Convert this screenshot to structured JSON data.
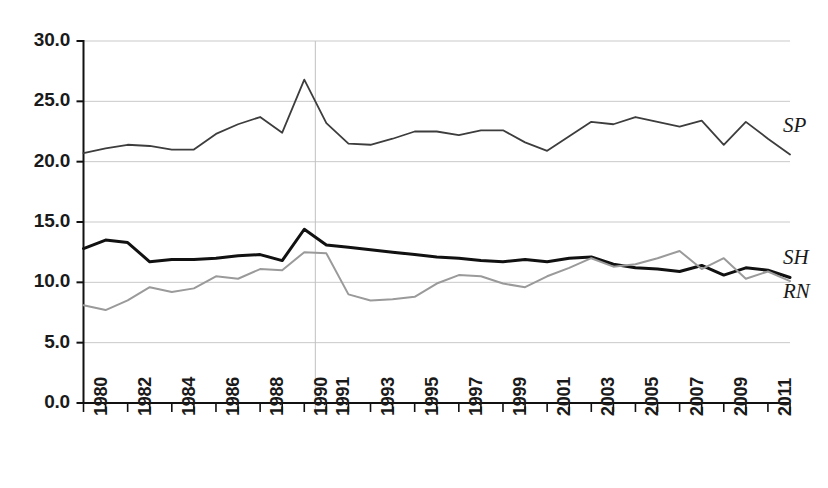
{
  "chart_data": {
    "type": "line",
    "title": "",
    "subtitle": "",
    "xlabel": "",
    "ylabel": "",
    "xlim": [
      1980,
      2012
    ],
    "ylim": [
      0.0,
      30.0
    ],
    "grid": true,
    "grid_axis": "y",
    "legend_position": "right-inline",
    "y_ticks": [
      "0.0",
      "5.0",
      "10.0",
      "15.0",
      "20.0",
      "25.0",
      "30.0"
    ],
    "y_tick_values": [
      0.0,
      5.0,
      10.0,
      15.0,
      20.0,
      25.0,
      30.0
    ],
    "x_tick_values": [
      1980,
      1981,
      1982,
      1983,
      1984,
      1985,
      1986,
      1987,
      1988,
      1989,
      1990,
      1991,
      1992,
      1993,
      1994,
      1995,
      1996,
      1997,
      1998,
      1999,
      2000,
      2001,
      2002,
      2003,
      2004,
      2005,
      2006,
      2007,
      2008,
      2009,
      2010,
      2011,
      2012
    ],
    "x_tick_labels": [
      "1980",
      "",
      "1982",
      "",
      "1984",
      "",
      "1986",
      "",
      "1988",
      "",
      "1990",
      "1991",
      "",
      "1993",
      "",
      "1995",
      "",
      "1997",
      "",
      "1999",
      "",
      "2001",
      "",
      "2003",
      "",
      "2005",
      "",
      "2007",
      "",
      "2009",
      "",
      "2011",
      ""
    ],
    "annotations": [
      {
        "name": "vertical-reference-line",
        "x": 1990.5,
        "style": "thin grey vertical rule"
      }
    ],
    "x": [
      1980,
      1981,
      1982,
      1983,
      1984,
      1985,
      1986,
      1987,
      1988,
      1989,
      1990,
      1991,
      1992,
      1993,
      1994,
      1995,
      1996,
      1997,
      1998,
      1999,
      2000,
      2001,
      2002,
      2003,
      2004,
      2005,
      2006,
      2007,
      2008,
      2009,
      2010,
      2011,
      2012
    ],
    "series": [
      {
        "name": "SP",
        "label": "SP",
        "color": "#3d3d3d",
        "width": 1.8,
        "values": [
          20.7,
          21.1,
          21.4,
          21.3,
          21.0,
          21.0,
          22.3,
          23.1,
          23.7,
          22.4,
          26.8,
          23.2,
          21.5,
          21.4,
          21.9,
          22.5,
          22.5,
          22.2,
          22.6,
          22.6,
          21.6,
          20.9,
          22.1,
          23.3,
          23.1,
          23.7,
          23.3,
          22.9,
          23.4,
          21.4,
          23.3,
          21.9,
          20.6
        ]
      },
      {
        "name": "SH",
        "label": "SH",
        "color": "#111111",
        "width": 3.0,
        "values": [
          12.8,
          13.5,
          13.3,
          11.7,
          11.9,
          11.9,
          12.0,
          12.2,
          12.3,
          11.8,
          14.4,
          13.1,
          12.9,
          12.7,
          12.5,
          12.3,
          12.1,
          12.0,
          11.8,
          11.7,
          11.9,
          11.7,
          12.0,
          12.1,
          11.5,
          11.2,
          11.1,
          10.9,
          11.4,
          10.6,
          11.2,
          11.0,
          10.4
        ]
      },
      {
        "name": "RN",
        "label": "RN",
        "color": "#9a9a9a",
        "width": 2.0,
        "values": [
          8.1,
          7.7,
          8.5,
          9.6,
          9.2,
          9.5,
          10.5,
          10.3,
          11.1,
          11.0,
          12.5,
          12.4,
          9.0,
          8.5,
          8.6,
          8.8,
          9.9,
          10.6,
          10.5,
          9.9,
          9.6,
          10.5,
          11.2,
          12.0,
          11.3,
          11.5,
          12.0,
          12.6,
          11.1,
          12.0,
          10.3,
          10.9,
          10.1
        ]
      }
    ]
  },
  "labels": {
    "sp": "SP",
    "sh": "SH",
    "rn": "RN"
  }
}
